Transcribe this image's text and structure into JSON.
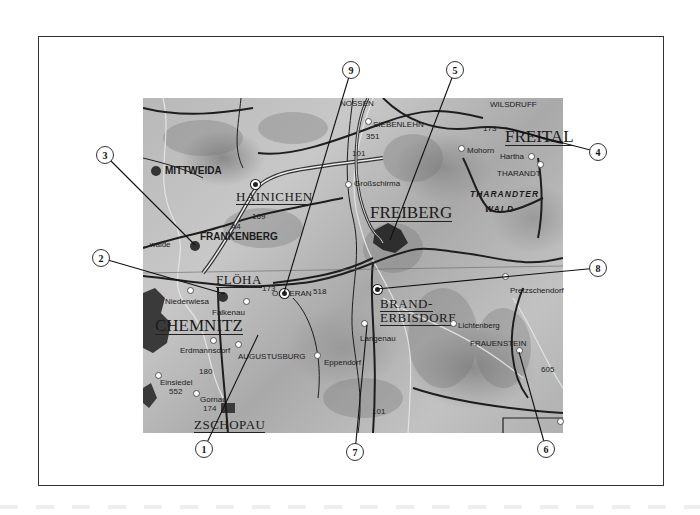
{
  "map": {
    "region": "Freiberg / Chemnitz area topographic map",
    "cities": [
      {
        "id": "chemnitz",
        "label": "CHEMNITZ",
        "x": 155,
        "y": 317,
        "class": "big"
      },
      {
        "id": "freiberg",
        "label": "FREIBERG",
        "x": 370,
        "y": 204,
        "class": "big"
      },
      {
        "id": "freital",
        "label": "FREITAL",
        "x": 505,
        "y": 128,
        "class": "big"
      },
      {
        "id": "floeha",
        "label": "FLÖHA",
        "x": 216,
        "y": 273,
        "class": "city"
      },
      {
        "id": "hainichen",
        "label": "HAINICHEN",
        "x": 236,
        "y": 190,
        "class": "city"
      },
      {
        "id": "zschopau",
        "label": "ZSCHOPAU",
        "x": 194,
        "y": 418,
        "class": "city"
      },
      {
        "id": "brand-erbisdorf",
        "label": "BRAND-",
        "label2": "ERBISDORF",
        "x": 380,
        "y": 297,
        "class": "city"
      }
    ],
    "towns": [
      {
        "id": "mittweida",
        "label": "MITTWEIDA",
        "x": 165,
        "y": 166,
        "class": "bold"
      },
      {
        "id": "frankenberg",
        "label": "FRANKENBERG",
        "x": 200,
        "y": 232,
        "class": "bold"
      },
      {
        "id": "oederan",
        "label": "OEDERAN",
        "x": 272,
        "y": 290,
        "class": "town"
      },
      {
        "id": "augustusburg",
        "label": "AUGUSTUSBURG",
        "x": 238,
        "y": 353,
        "class": "town"
      },
      {
        "id": "erdmannsdorf",
        "label": "Erdmannsdorf",
        "x": 180,
        "y": 347,
        "class": "town"
      },
      {
        "id": "einsiedel",
        "label": "Einsiedel",
        "x": 160,
        "y": 379,
        "class": "town"
      },
      {
        "id": "gornau",
        "label": "Gornau",
        "x": 200,
        "y": 396,
        "class": "town"
      },
      {
        "id": "eppendorf",
        "label": "Eppendorf",
        "x": 324,
        "y": 359,
        "class": "town"
      },
      {
        "id": "langenau",
        "label": "Langenau",
        "x": 360,
        "y": 335,
        "class": "town"
      },
      {
        "id": "lichtenberg",
        "label": "Lichtenberg",
        "x": 458,
        "y": 322,
        "class": "town"
      },
      {
        "id": "frauenstein",
        "label": "FRAUENSTEIN",
        "x": 470,
        "y": 340,
        "class": "town"
      },
      {
        "id": "pretzschendorf",
        "label": "Pretzschendorf",
        "x": 510,
        "y": 287,
        "class": "town"
      },
      {
        "id": "mohorn",
        "label": "Mohorn",
        "x": 467,
        "y": 147,
        "class": "town"
      },
      {
        "id": "hartha",
        "label": "Hartha",
        "x": 500,
        "y": 153,
        "class": "town"
      },
      {
        "id": "tharandt",
        "label": "THARANDT",
        "x": 497,
        "y": 170,
        "class": "town"
      },
      {
        "id": "grossschirma",
        "label": "Großschirma",
        "x": 354,
        "y": 180,
        "class": "town"
      },
      {
        "id": "siebenlehn",
        "label": "SIEBENLEHN",
        "x": 373,
        "y": 121,
        "class": "town"
      },
      {
        "id": "nossen",
        "label": "NOSSEN",
        "x": 340,
        "y": 100,
        "class": "town"
      },
      {
        "id": "wilsdruff",
        "label": "WILSDRUFF",
        "x": 490,
        "y": 101,
        "class": "town"
      },
      {
        "id": "niederwiesa",
        "label": "Niederwiesa",
        "x": 165,
        "y": 298,
        "class": "town"
      },
      {
        "id": "falkenau",
        "label": "Falkenau",
        "x": 212,
        "y": 309,
        "class": "town"
      },
      {
        "id": "wald",
        "label": "...walde",
        "x": 143,
        "y": 241,
        "class": "town"
      }
    ],
    "areas": [
      {
        "id": "tharandter-wald-1",
        "label": "THARANDTER",
        "x": 470,
        "y": 190
      },
      {
        "id": "tharandter-wald-2",
        "label": "WALD",
        "x": 485,
        "y": 205
      }
    ],
    "road_numbers": [
      {
        "label": "A4",
        "x": 231,
        "y": 223
      },
      {
        "label": "169",
        "x": 252,
        "y": 213
      },
      {
        "label": "173",
        "x": 262,
        "y": 285
      },
      {
        "label": "518",
        "x": 313,
        "y": 288
      },
      {
        "label": "101",
        "x": 352,
        "y": 150
      },
      {
        "label": "351",
        "x": 366,
        "y": 133
      },
      {
        "label": "173",
        "x": 483,
        "y": 125
      },
      {
        "label": "180",
        "x": 199,
        "y": 368
      },
      {
        "label": "552",
        "x": 169,
        "y": 388
      },
      {
        "label": "174",
        "x": 203,
        "y": 405
      },
      {
        "label": "101",
        "x": 372,
        "y": 408
      },
      {
        "label": "605",
        "x": 541,
        "y": 366
      }
    ],
    "colors": {
      "frame": "#333333",
      "map_dark": "#333333",
      "map_light": "#c8c8c8",
      "callout_fill": "#ffffff"
    }
  },
  "callouts": [
    {
      "n": "1",
      "x": 195,
      "y": 440,
      "tx": 258,
      "ty": 335
    },
    {
      "n": "2",
      "x": 92,
      "y": 249,
      "tx": 225,
      "ty": 294
    },
    {
      "n": "3",
      "x": 96,
      "y": 146,
      "tx": 195,
      "ty": 245
    },
    {
      "n": "4",
      "x": 589,
      "y": 143,
      "tx": 505,
      "ty": 128
    },
    {
      "n": "5",
      "x": 446,
      "y": 61,
      "tx": 390,
      "ty": 240
    },
    {
      "n": "6",
      "x": 537,
      "y": 440,
      "tx": 519,
      "ty": 352
    },
    {
      "n": "7",
      "x": 346,
      "y": 443,
      "tx": 367,
      "ty": 325
    },
    {
      "n": "8",
      "x": 589,
      "y": 259,
      "tx": 377,
      "ty": 289
    },
    {
      "n": "9",
      "x": 342,
      "y": 61,
      "tx": 284,
      "ty": 293
    }
  ]
}
